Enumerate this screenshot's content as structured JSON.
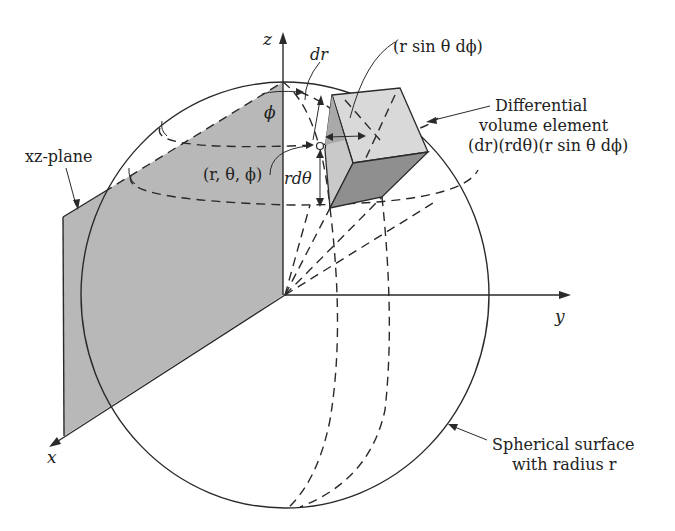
{
  "figure": {
    "colors": {
      "background": "#ffffff",
      "line": "#2a2a2a",
      "plane_fill": "#b8b8b8",
      "box_top": "#d9d9d9",
      "box_front": "#c7c7c7",
      "box_bottom": "#8f8f8f",
      "box_side": "#a9a9a9"
    }
  },
  "axes": {
    "z": "z",
    "x": "x",
    "y": "y"
  },
  "labels": {
    "xz_plane": "xz-plane",
    "phi": "ϕ",
    "dr": "dr",
    "r_sin_theta_dphi": "(r sin θ dϕ)",
    "point": "(r, θ, ϕ)",
    "r_dtheta": "rdθ",
    "volume_line1": "Differential",
    "volume_line2": "volume element",
    "volume_line3": "(dr)(rdθ)(r sin θ dϕ)",
    "surface_line1": "Spherical surface",
    "surface_line2": "with radius r"
  }
}
